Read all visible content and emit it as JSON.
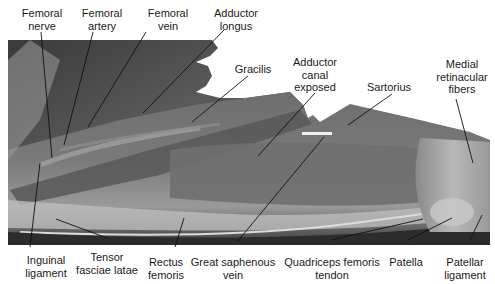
{
  "figure": {
    "type": "anatomical-photograph",
    "colors": {
      "background": "#ffffff",
      "label_text": "#1a1a1a",
      "leader_lines": "#111111"
    }
  },
  "labels": {
    "top": [
      {
        "id": "femoral-nerve",
        "lines": [
          "Femoral",
          "nerve"
        ]
      },
      {
        "id": "femoral-artery",
        "lines": [
          "Femoral",
          "artery"
        ]
      },
      {
        "id": "femoral-vein",
        "lines": [
          "Femoral",
          "vein"
        ]
      },
      {
        "id": "adductor-longus",
        "lines": [
          "Adductor",
          "longus"
        ]
      },
      {
        "id": "gracilis",
        "lines": [
          "Gracilis"
        ]
      },
      {
        "id": "adductor-canal-exposed",
        "lines": [
          "Adductor",
          "canal",
          "exposed"
        ]
      },
      {
        "id": "sartorius",
        "lines": [
          "Sartorius"
        ]
      },
      {
        "id": "medial-retinacular-fibers",
        "lines": [
          "Medial",
          "retinacular",
          "fibers"
        ]
      }
    ],
    "bottom": [
      {
        "id": "inguinal-ligament",
        "lines": [
          "Inguinal",
          "ligament"
        ]
      },
      {
        "id": "tensor-fasciae-latae",
        "lines": [
          "Tensor",
          "fasciae latae"
        ]
      },
      {
        "id": "rectus-femoris",
        "lines": [
          "Rectus",
          "femoris"
        ]
      },
      {
        "id": "great-saphenous-vein",
        "lines": [
          "Great saphenous",
          "vein"
        ]
      },
      {
        "id": "quadriceps-femoris-tendon",
        "lines": [
          "Quadriceps femoris",
          "tendon"
        ]
      },
      {
        "id": "patella",
        "lines": [
          "Patella"
        ]
      },
      {
        "id": "patellar-ligament",
        "lines": [
          "Patellar",
          "ligament"
        ]
      }
    ]
  }
}
